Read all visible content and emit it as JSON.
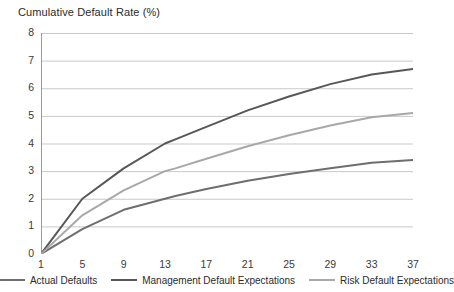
{
  "chart_data": {
    "type": "line",
    "title": "Cumulative Default Rate (%)",
    "xlabel": "",
    "ylabel": "",
    "xlim": [
      1,
      37
    ],
    "ylim": [
      0,
      8
    ],
    "yticks": [
      0,
      1,
      2,
      3,
      4,
      5,
      6,
      7,
      8
    ],
    "xticks": [
      1,
      5,
      9,
      13,
      17,
      21,
      25,
      29,
      33,
      37
    ],
    "x_minor_tick_step": 1,
    "grid": "horizontal",
    "legend_position": "bottom",
    "x": [
      1,
      5,
      9,
      13,
      14,
      17,
      21,
      25,
      29,
      33,
      37
    ],
    "series": [
      {
        "name": "Actual Defaults",
        "color": "#6e6e6e",
        "values": [
          0,
          0.9,
          1.6,
          2.0,
          2.1,
          2.35,
          2.65,
          2.9,
          3.1,
          3.3,
          3.4
        ]
      },
      {
        "name": "Management Default Expectations",
        "color": "#575757",
        "values": [
          0,
          2.0,
          3.1,
          4.0,
          4.15,
          4.6,
          5.2,
          5.7,
          6.15,
          6.5,
          6.7
        ]
      },
      {
        "name": "Risk Default Expectations",
        "color": "#a8a8a8",
        "values": [
          0,
          1.4,
          2.3,
          3.0,
          3.1,
          3.45,
          3.9,
          4.3,
          4.65,
          4.95,
          5.1
        ]
      }
    ]
  },
  "axis": {
    "y_labels": [
      "8",
      "7",
      "6",
      "5",
      "4",
      "3",
      "2",
      "1",
      "0"
    ],
    "x_labels": [
      "1",
      "5",
      "9",
      "13",
      "17",
      "21",
      "25",
      "29",
      "33",
      "37"
    ]
  },
  "legend": {
    "items": [
      {
        "label": "Actual Defaults",
        "color": "#6e6e6e"
      },
      {
        "label": "Management Default Expectations",
        "color": "#575757"
      },
      {
        "label": "Risk Default Expectations",
        "color": "#a8a8a8"
      }
    ]
  },
  "style": {
    "gridline_color": "#c9c9c9",
    "axis_color": "#9a9a9a",
    "text_color": "#2b2b2b"
  }
}
